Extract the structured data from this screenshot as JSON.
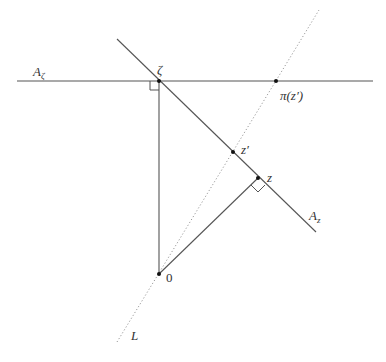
{
  "diagram": {
    "labels": {
      "A_zeta": "A",
      "A_zeta_sub": "ζ",
      "zeta": "ζ",
      "pi_z_prime": "π(z′)",
      "z_prime": "z′",
      "z": "z",
      "A_z": "A",
      "A_z_sub": "z",
      "origin": "0",
      "L": "L"
    },
    "points": {
      "zeta": [
        159,
        81
      ],
      "pi_z_prime": [
        276,
        81
      ],
      "z_prime": [
        233,
        152
      ],
      "z": [
        258,
        178
      ],
      "origin": [
        159,
        274
      ]
    },
    "lines": {
      "A_zeta_line": {
        "from": [
          17,
          81
        ],
        "to": [
          373,
          81
        ],
        "style": "solid"
      },
      "A_z_line": {
        "from": [
          117,
          39
        ],
        "to": [
          316,
          232
        ],
        "style": "solid"
      },
      "zeta_to_origin": {
        "from": [
          159,
          81
        ],
        "to": [
          159,
          274
        ],
        "style": "solid"
      },
      "origin_to_z": {
        "from": [
          159,
          274
        ],
        "to": [
          258,
          178
        ],
        "style": "solid"
      },
      "L_line": {
        "from": [
          117,
          342
        ],
        "to": [
          319,
          10
        ],
        "style": "dotted"
      }
    },
    "colors": {
      "line": "#555555",
      "dotted": "#999999",
      "point": "#111111",
      "background": "#ffffff"
    }
  }
}
